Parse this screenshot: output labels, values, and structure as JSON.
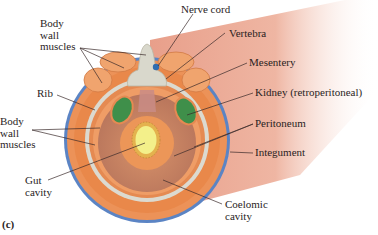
{
  "figure": {
    "panel_label": "(c)"
  },
  "labels": {
    "body_wall_muscles_top": "Body\nwall\nmuscles",
    "nerve_cord": "Nerve cord",
    "vertebra": "Vertebra",
    "mesentery": "Mesentery",
    "kidney": "Kidney (retroperitoneal)",
    "rib": "Rib",
    "body_wall_muscles_bottom": "Body\nwall\nmuscles",
    "peritoneum": "Peritoneum",
    "integument": "Integument",
    "gut_cavity": "Gut\ncavity",
    "coelomic_cavity": "Coelomic\ncavity"
  },
  "colors": {
    "integument": "#5b84c4",
    "muscle": "#e9884a",
    "muscle_light": "#f2a873",
    "bone": "#d9d8cc",
    "kidney": "#3f8f4a",
    "gut_lumen": "#f3f08a",
    "coelom": "#c98a66",
    "tube_skin": "#eba58c",
    "nerve": "#2f6db0",
    "leader": "#3a2a2a"
  }
}
